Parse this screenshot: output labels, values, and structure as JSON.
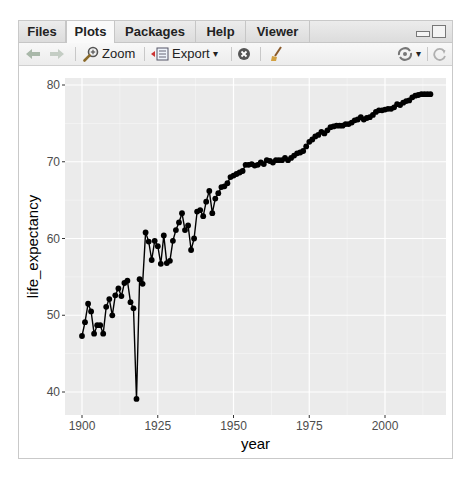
{
  "tabs": [
    {
      "label": "Files",
      "active": false
    },
    {
      "label": "Plots",
      "active": true
    },
    {
      "label": "Packages",
      "active": false
    },
    {
      "label": "Help",
      "active": false
    },
    {
      "label": "Viewer",
      "active": false
    }
  ],
  "toolbar": {
    "back_icon": "arrow-left-icon",
    "forward_icon": "arrow-right-icon",
    "zoom_label": "Zoom",
    "export_label": "Export",
    "export_caret": "▾",
    "remove_icon": "remove-plot-icon",
    "clear_icon": "broom-icon",
    "publish_icon": "publish-icon",
    "publish_caret": "▾",
    "refresh_icon": "refresh-icon"
  },
  "colors": {
    "panel_bg": "#ebebeb",
    "grid": "#ffffff",
    "series": "#000000"
  },
  "chart_data": {
    "type": "line",
    "title": "",
    "xlabel": "year",
    "ylabel": "life_expectancy",
    "xlim": [
      1894,
      2020
    ],
    "ylim": [
      37,
      80.9
    ],
    "x_ticks": [
      1900,
      1925,
      1950,
      1975,
      2000
    ],
    "y_ticks": [
      40,
      50,
      60,
      70,
      80
    ],
    "grid": true,
    "legend": null,
    "markers": "points",
    "series": [
      {
        "name": "life_expectancy",
        "x": [
          1900,
          1901,
          1902,
          1903,
          1904,
          1905,
          1906,
          1907,
          1908,
          1909,
          1910,
          1911,
          1912,
          1913,
          1914,
          1915,
          1916,
          1917,
          1918,
          1919,
          1920,
          1921,
          1922,
          1923,
          1924,
          1925,
          1926,
          1927,
          1928,
          1929,
          1930,
          1931,
          1932,
          1933,
          1934,
          1935,
          1936,
          1937,
          1938,
          1939,
          1940,
          1941,
          1942,
          1943,
          1944,
          1945,
          1946,
          1947,
          1948,
          1949,
          1950,
          1951,
          1952,
          1953,
          1954,
          1955,
          1956,
          1957,
          1958,
          1959,
          1960,
          1961,
          1962,
          1963,
          1964,
          1965,
          1966,
          1967,
          1968,
          1969,
          1970,
          1971,
          1972,
          1973,
          1974,
          1975,
          1976,
          1977,
          1978,
          1979,
          1980,
          1981,
          1982,
          1983,
          1984,
          1985,
          1986,
          1987,
          1988,
          1989,
          1990,
          1991,
          1992,
          1993,
          1994,
          1995,
          1996,
          1997,
          1998,
          1999,
          2000,
          2001,
          2002,
          2003,
          2004,
          2005,
          2006,
          2007,
          2008,
          2009,
          2010,
          2011,
          2012,
          2013,
          2014,
          2015
        ],
        "values": [
          47.3,
          49.1,
          51.5,
          50.5,
          47.6,
          48.7,
          48.7,
          47.6,
          51.1,
          52.1,
          50.0,
          52.6,
          53.5,
          52.5,
          54.2,
          54.5,
          51.7,
          50.9,
          39.1,
          54.7,
          54.1,
          60.8,
          59.6,
          57.2,
          59.7,
          59.0,
          56.7,
          60.4,
          56.8,
          57.1,
          59.7,
          61.1,
          62.1,
          63.3,
          61.1,
          61.7,
          58.5,
          60.0,
          63.5,
          63.7,
          62.9,
          64.8,
          66.2,
          63.3,
          65.2,
          65.9,
          66.7,
          66.8,
          67.2,
          68.0,
          68.2,
          68.4,
          68.6,
          68.8,
          69.6,
          69.6,
          69.7,
          69.5,
          69.6,
          69.9,
          69.7,
          70.2,
          70.1,
          69.9,
          70.2,
          70.2,
          70.2,
          70.5,
          70.2,
          70.5,
          70.8,
          71.1,
          71.2,
          71.4,
          72.0,
          72.6,
          72.9,
          73.3,
          73.5,
          73.9,
          73.7,
          74.1,
          74.5,
          74.6,
          74.7,
          74.7,
          74.7,
          74.9,
          74.9,
          75.1,
          75.4,
          75.5,
          75.8,
          75.5,
          75.7,
          75.8,
          76.1,
          76.5,
          76.7,
          76.7,
          76.8,
          76.9,
          76.9,
          77.1,
          77.5,
          77.4,
          77.7,
          77.9,
          78.0,
          78.4,
          78.6,
          78.7,
          78.8,
          78.8,
          78.8,
          78.8
        ]
      }
    ]
  }
}
